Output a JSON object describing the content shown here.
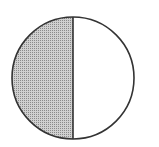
{
  "diagram": {
    "type": "fraction-circle",
    "parts_total": 2,
    "parts_shaded": 1,
    "shaded_side": "left",
    "colors": {
      "outline": "#333333",
      "shade": "#b8b8b8",
      "background": "#ffffff"
    }
  }
}
